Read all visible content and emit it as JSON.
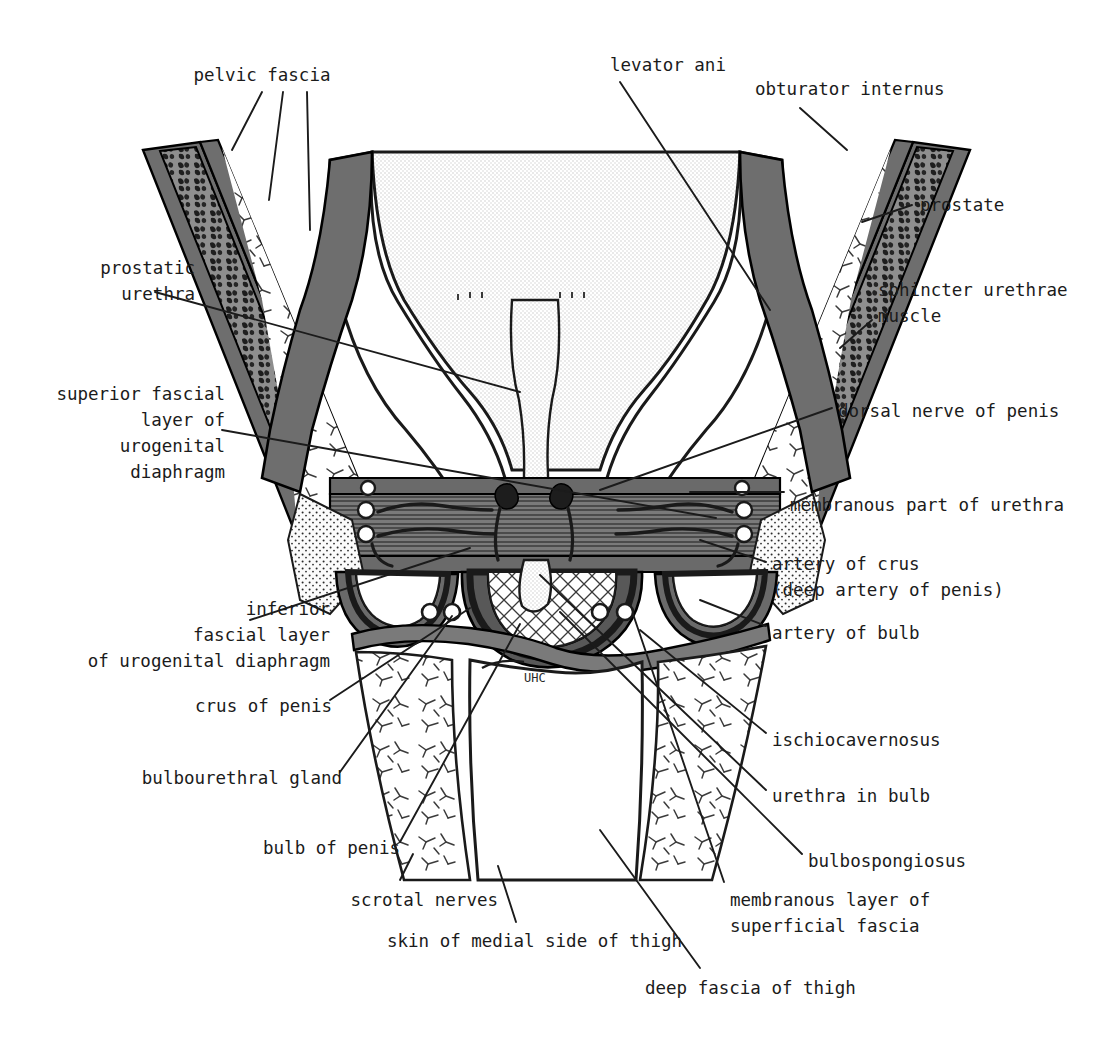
{
  "figure": {
    "domain": "anatomical-diagram",
    "palette": {
      "ink": "#1b1b1b",
      "outline": "#000000",
      "muscle_gray": "#6e6e6e",
      "muscle_gray_dark": "#4a4a4a",
      "fat_light": "#e8e8e8",
      "bladder_stipple": "#dcdcdc",
      "bone_speckle": "#8a8a8a",
      "background": "#ffffff"
    }
  },
  "labels": [
    {
      "id": "pelvic-fascia",
      "text": "pelvic fascia",
      "align": "center",
      "x": 182,
      "y": 62,
      "w": 160
    },
    {
      "id": "levator-ani",
      "text": "levator ani",
      "align": "center",
      "x": 600,
      "y": 52,
      "w": 136
    },
    {
      "id": "obturator-internus",
      "text": "obturator internus",
      "align": "left",
      "x": 755,
      "y": 76,
      "w": 210
    },
    {
      "id": "prostate",
      "text": "prostate",
      "align": "left",
      "x": 920,
      "y": 192,
      "w": 110
    },
    {
      "id": "prostatic-urethra",
      "text": "prostatic\nurethra",
      "align": "right",
      "x": 35,
      "y": 255,
      "w": 160
    },
    {
      "id": "sphincter-urethrae",
      "text": "sphincter urethrae\nmuscle",
      "align": "left",
      "x": 878,
      "y": 277,
      "w": 230
    },
    {
      "id": "superior-fascial",
      "text": "superior fascial\nlayer of\nurogenital\ndiaphragm",
      "align": "right",
      "x": 15,
      "y": 381,
      "w": 210
    },
    {
      "id": "dorsal-nerve-penis",
      "text": "dorsal nerve of penis",
      "align": "left",
      "x": 838,
      "y": 398,
      "w": 260
    },
    {
      "id": "membranous-urethra",
      "text": "membranous part of urethra",
      "align": "left",
      "x": 790,
      "y": 492,
      "w": 320
    },
    {
      "id": "artery-of-crus",
      "text": "artery of crus\n(deep artery of penis)",
      "align": "left",
      "x": 772,
      "y": 551,
      "w": 300
    },
    {
      "id": "inferior-fascial",
      "text": "inferior\nfascial layer\nof urogenital diaphragm",
      "align": "right",
      "x": 10,
      "y": 596,
      "w": 320
    },
    {
      "id": "artery-of-bulb",
      "text": "artery of bulb",
      "align": "left",
      "x": 772,
      "y": 620,
      "w": 180
    },
    {
      "id": "crus-of-penis",
      "text": "crus of penis",
      "align": "right",
      "x": 100,
      "y": 693,
      "w": 232
    },
    {
      "id": "ischiocavernosus",
      "text": "ischiocavernosus",
      "align": "left",
      "x": 772,
      "y": 727,
      "w": 210
    },
    {
      "id": "bulbourethral-gland",
      "text": "bulbourethral gland",
      "align": "right",
      "x": 90,
      "y": 765,
      "w": 252
    },
    {
      "id": "urethra-in-bulb",
      "text": "urethra in bulb",
      "align": "left",
      "x": 772,
      "y": 783,
      "w": 190
    },
    {
      "id": "bulb-of-penis",
      "text": "bulb of penis",
      "align": "right",
      "x": 160,
      "y": 835,
      "w": 240
    },
    {
      "id": "bulbospongiosus",
      "text": "bulbospongiosus",
      "align": "left",
      "x": 808,
      "y": 848,
      "w": 200
    },
    {
      "id": "scrotal-nerves",
      "text": "scrotal nerves",
      "align": "right",
      "x": 248,
      "y": 887,
      "w": 250
    },
    {
      "id": "membranous-layer",
      "text": "membranous layer of\nsuperficial fascia",
      "align": "left",
      "x": 730,
      "y": 887,
      "w": 250
    },
    {
      "id": "skin-medial-thigh",
      "text": "skin of medial side of thigh",
      "align": "right",
      "x": 330,
      "y": 928,
      "w": 352
    },
    {
      "id": "deep-fascia-thigh",
      "text": "deep fascia of thigh",
      "align": "left",
      "x": 645,
      "y": 975,
      "w": 250
    }
  ],
  "leaders": [
    {
      "id": "leader-pelvic-fascia-a",
      "from": [
        262,
        92
      ],
      "to": [
        232,
        150
      ]
    },
    {
      "id": "leader-pelvic-fascia-b",
      "from": [
        283,
        92
      ],
      "to": [
        269,
        200
      ]
    },
    {
      "id": "leader-pelvic-fascia-c",
      "from": [
        307,
        92
      ],
      "to": [
        310,
        230
      ]
    },
    {
      "id": "leader-levator-ani",
      "from": [
        620,
        82
      ],
      "to": [
        770,
        310
      ]
    },
    {
      "id": "leader-obturator",
      "from": [
        800,
        108
      ],
      "to": [
        847,
        150
      ]
    },
    {
      "id": "leader-prostate",
      "from": [
        912,
        205
      ],
      "to": [
        862,
        222
      ]
    },
    {
      "id": "leader-prostatic-ur",
      "from": [
        155,
        292
      ],
      "to": [
        520,
        392
      ]
    },
    {
      "id": "leader-sphincter",
      "from": [
        872,
        320
      ],
      "to": [
        840,
        348
      ]
    },
    {
      "id": "leader-superior-f",
      "from": [
        222,
        430
      ],
      "to": [
        716,
        518
      ]
    },
    {
      "id": "leader-dorsal-nerve",
      "from": [
        832,
        408
      ],
      "to": [
        600,
        490
      ]
    },
    {
      "id": "leader-membranous-ur",
      "from": [
        784,
        492
      ],
      "to": [
        690,
        492
      ]
    },
    {
      "id": "leader-artery-crus",
      "from": [
        766,
        562
      ],
      "to": [
        700,
        540
      ]
    },
    {
      "id": "leader-inferior-f",
      "from": [
        250,
        620
      ],
      "to": [
        470,
        548
      ]
    },
    {
      "id": "leader-artery-bulb",
      "from": [
        766,
        626
      ],
      "to": [
        700,
        600
      ]
    },
    {
      "id": "leader-crus-penis",
      "from": [
        330,
        700
      ],
      "to": [
        470,
        608
      ]
    },
    {
      "id": "leader-ischiocav",
      "from": [
        766,
        733
      ],
      "to": [
        640,
        630
      ]
    },
    {
      "id": "leader-bulbourethral",
      "from": [
        340,
        772
      ],
      "to": [
        452,
        616
      ]
    },
    {
      "id": "leader-urethra-bulb",
      "from": [
        766,
        790
      ],
      "to": [
        540,
        575
      ]
    },
    {
      "id": "leader-bulb-penis",
      "from": [
        400,
        842
      ],
      "to": [
        520,
        624
      ]
    },
    {
      "id": "leader-bulbospongiosus",
      "from": [
        802,
        854
      ],
      "to": [
        560,
        612
      ]
    },
    {
      "id": "leader-scrotal-nerves",
      "from": [
        400,
        880
      ],
      "to": [
        413,
        854
      ]
    },
    {
      "id": "leader-membranous-lay",
      "from": [
        724,
        882
      ],
      "to": [
        633,
        614
      ]
    },
    {
      "id": "leader-skin-thigh",
      "from": [
        516,
        922
      ],
      "to": [
        498,
        866
      ]
    },
    {
      "id": "leader-deep-fascia",
      "from": [
        700,
        968
      ],
      "to": [
        600,
        830
      ]
    }
  ],
  "structures": [
    {
      "id": "urinary-bladder",
      "name": "urinary bladder (stippled)"
    },
    {
      "id": "prostate-gland",
      "name": "prostate"
    },
    {
      "id": "prostatic-urethra-lumen",
      "name": "prostatic urethra"
    },
    {
      "id": "obturator-internus-muscle",
      "name": "obturator internus muscle"
    },
    {
      "id": "levator-ani-muscle",
      "name": "levator ani muscle"
    },
    {
      "id": "urogenital-diaphragm",
      "name": "urogenital diaphragm (deep transverse perineal)"
    },
    {
      "id": "crus-penis-left",
      "name": "left crus of penis"
    },
    {
      "id": "crus-penis-right",
      "name": "right crus of penis"
    },
    {
      "id": "bulb-penis-body",
      "name": "bulb of penis"
    },
    {
      "id": "bulbourethral-gland-left",
      "name": "left bulbourethral gland"
    },
    {
      "id": "bulbourethral-gland-right",
      "name": "right bulbourethral gland"
    },
    {
      "id": "thigh-left",
      "name": "left thigh"
    },
    {
      "id": "thigh-right",
      "name": "right thigh"
    },
    {
      "id": "scrotum-septum",
      "name": "scrotal septum / median raphe"
    }
  ],
  "watermark": {
    "text": "UHC",
    "x": 524,
    "y": 682
  }
}
